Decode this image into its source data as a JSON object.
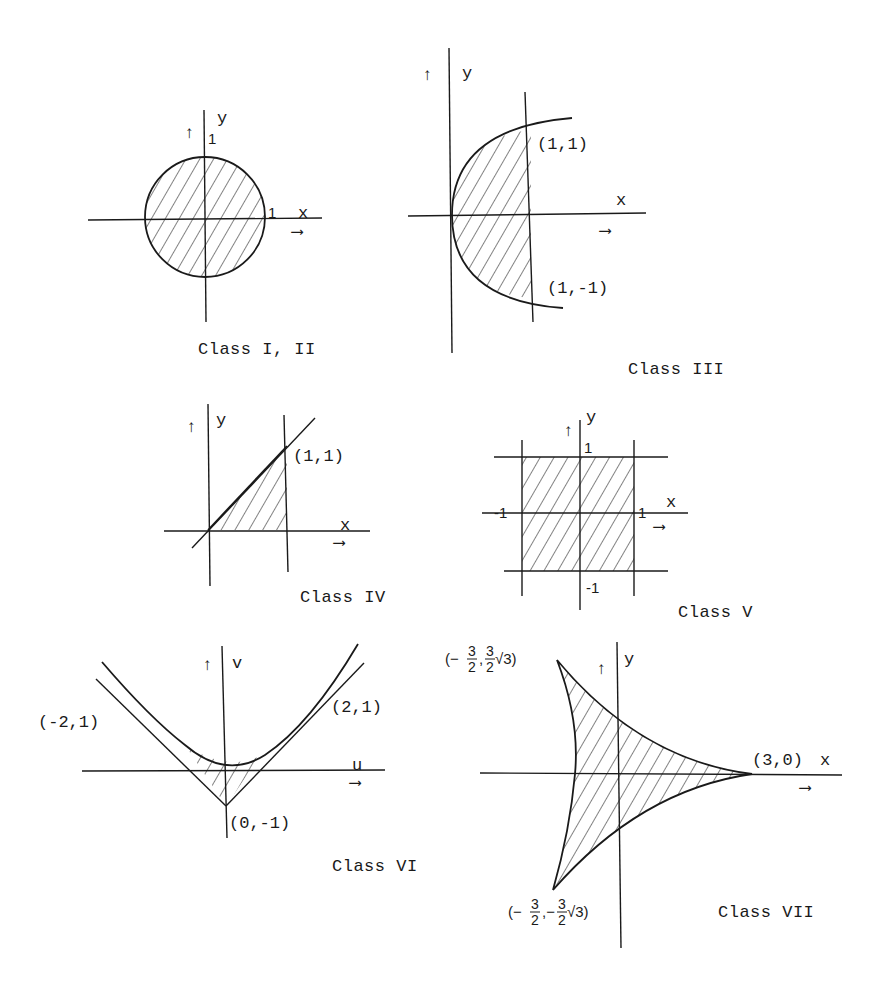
{
  "figure": {
    "panels": [
      {
        "id": "class-1-2",
        "caption": "Class I, II",
        "region": "unit disk",
        "axis_labels": {
          "x": "x",
          "y": "y"
        },
        "tick_labels": {
          "y_top": "1",
          "x_right": "1"
        }
      },
      {
        "id": "class-3",
        "caption": "Class III",
        "region": "parabola y^2 = x cut by x = 1",
        "axis_labels": {
          "x": "x",
          "y": "y"
        },
        "point_labels": {
          "upper": "(1,1)",
          "lower": "(1,-1)"
        }
      },
      {
        "id": "class-4",
        "caption": "Class IV",
        "region": "triangle under y = x for 0 ≤ x ≤ 1",
        "axis_labels": {
          "x": "x",
          "y": "y"
        },
        "point_labels": {
          "corner": "(1,1)"
        }
      },
      {
        "id": "class-5",
        "caption": "Class V",
        "region": "square -1 ≤ x,y ≤ 1",
        "axis_labels": {
          "x": "x",
          "y": "y"
        },
        "tick_labels": {
          "y_top": "1",
          "y_bottom": "-1",
          "x_left": "-1",
          "x_right": "1"
        }
      },
      {
        "id": "class-6",
        "caption": "Class VI",
        "region": "between parabola and its tangents",
        "axis_labels": {
          "x": "u",
          "y": "v"
        },
        "point_labels": {
          "left": "(-2,1)",
          "right": "(2,1)",
          "bottom": "(0,-1)"
        }
      },
      {
        "id": "class-7",
        "caption": "Class VII",
        "region": "deltoid (hypocycloid with three cusps)",
        "axis_labels": {
          "x": "x",
          "y": "y"
        },
        "point_labels": {
          "right": "(3,0)",
          "top_prefix": "(−",
          "top_num1": "3",
          "top_den1": "2",
          "top_sep": ",",
          "top_num2": "3",
          "top_den2": "2",
          "top_suffix": "√3)",
          "bottom_prefix": "(−",
          "bottom_num1": "3",
          "bottom_den1": "2",
          "bottom_sep": ",−",
          "bottom_num2": "3",
          "bottom_den2": "2",
          "bottom_suffix": "√3)"
        }
      }
    ],
    "arrow_glyphs": {
      "up": "↑",
      "right": "⟶"
    }
  }
}
